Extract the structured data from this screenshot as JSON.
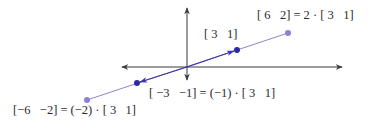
{
  "diagram": {
    "colors": {
      "axis": "#3a3a3a",
      "line_light": "#8e86d6",
      "line_dark": "#3b39a8",
      "dot_dark": "#2e2aa0",
      "dot_light": "#8a83d4",
      "text": "#2a2a2a"
    },
    "axes": {
      "origin_px": [
        187,
        67
      ],
      "x_axis_px": [
        122,
        342
      ],
      "y_axis_px": [
        8,
        80
      ]
    },
    "points": [
      {
        "id": "v",
        "vector": [
          3,
          1
        ],
        "px": [
          237,
          50
        ],
        "style": "dark"
      },
      {
        "id": "2v",
        "vector": [
          6,
          2
        ],
        "px": [
          288,
          33
        ],
        "style": "light"
      },
      {
        "id": "neg_v",
        "vector": [
          -3,
          -1
        ],
        "px": [
          137,
          83
        ],
        "style": "dark"
      },
      {
        "id": "neg_2v",
        "vector": [
          -6,
          -2
        ],
        "px": [
          87,
          100
        ],
        "style": "light"
      }
    ],
    "labels": {
      "v": "[ 3   1]",
      "two_v": "[ 6   2] = 2 · [ 3   1]",
      "neg_v": "[ −3   −1] = (−1) · [ 3   1]",
      "neg_two_v": "[−6   −2] = (−2) · [ 3   1]"
    }
  }
}
